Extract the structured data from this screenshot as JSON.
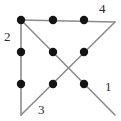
{
  "figure": {
    "width": 121,
    "height": 121,
    "background_color": "#ffffff",
    "edge_color": "#8c8c8c",
    "node_color": "#141414",
    "label_color": "#2b2b2b",
    "node_radius": 4.2,
    "edge_stroke_width": 1.6
  },
  "corners": {
    "top_left": {
      "x": 21,
      "y": 20
    },
    "top_right": {
      "x": 115,
      "y": 22
    },
    "bottom_left": {
      "x": 21,
      "y": 115
    },
    "bottom_right": {
      "x": 115,
      "y": 115
    }
  },
  "edges": [
    {
      "id": "edge-2-left-vertical",
      "label": "2",
      "x1": 21,
      "y1": 20,
      "x2": 21,
      "y2": 115
    },
    {
      "id": "edge-4-top-horizontal",
      "label": "4",
      "x1": 21,
      "y1": 20,
      "x2": 115,
      "y2": 22
    },
    {
      "id": "edge-1-diagonal-tl-br",
      "label": "1",
      "x1": 21,
      "y1": 20,
      "x2": 115,
      "y2": 115
    },
    {
      "id": "edge-3-diagonal-bl-tr",
      "label": "3",
      "x1": 21,
      "y1": 115,
      "x2": 115,
      "y2": 22
    }
  ],
  "nodes": [
    {
      "id": "node-1",
      "x": 21,
      "y": 20
    },
    {
      "id": "node-2",
      "x": 53,
      "y": 20
    },
    {
      "id": "node-3",
      "x": 84,
      "y": 20
    },
    {
      "id": "node-4",
      "x": 21,
      "y": 52
    },
    {
      "id": "node-5",
      "x": 53,
      "y": 52
    },
    {
      "id": "node-6",
      "x": 84,
      "y": 52
    },
    {
      "id": "node-7",
      "x": 21,
      "y": 84
    },
    {
      "id": "node-8",
      "x": 53,
      "y": 84
    },
    {
      "id": "node-9",
      "x": 84,
      "y": 84
    }
  ],
  "labels": [
    {
      "id": "label-4",
      "text": "4",
      "x": 99,
      "y": 2
    },
    {
      "id": "label-2",
      "text": "2",
      "x": 4,
      "y": 30
    },
    {
      "id": "label-1",
      "text": "1",
      "x": 105,
      "y": 80
    },
    {
      "id": "label-3",
      "text": "3",
      "x": 38,
      "y": 103
    }
  ]
}
